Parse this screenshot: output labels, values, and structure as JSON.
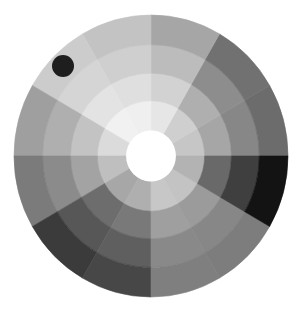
{
  "canvas": {
    "width": 300,
    "height": 314,
    "background": "#ffffff"
  },
  "wheel": {
    "center": {
      "x": 151,
      "y": 156
    },
    "radius_x": 137,
    "radius_y": 141,
    "hole_radius": 25,
    "hole_color": "#ffffff",
    "ring_radii": [
      25,
      54,
      81,
      109,
      138
    ],
    "sector_count": 12,
    "sector_angle_deg": 30,
    "angle_origin": "east, counterclockwise",
    "sectors": [
      {
        "from_deg": 0,
        "to_deg": 30,
        "ring_colors": [
          "#c6c6c6",
          "#a6a6a6",
          "#878787",
          "#6c6c6c"
        ]
      },
      {
        "from_deg": 30,
        "to_deg": 60,
        "ring_colors": [
          "#cfcfcf",
          "#afafaf",
          "#8d8d8d",
          "#717171"
        ]
      },
      {
        "from_deg": 60,
        "to_deg": 90,
        "ring_colors": [
          "#e6e6e6",
          "#d2d2d2",
          "#bcbcbc",
          "#a6a6a6"
        ]
      },
      {
        "from_deg": 90,
        "to_deg": 120,
        "ring_colors": [
          "#efefef",
          "#dfdfdf",
          "#cfcfcf",
          "#c3c3c3"
        ]
      },
      {
        "from_deg": 120,
        "to_deg": 150,
        "ring_colors": [
          "#f1f1f1",
          "#e3e3e3",
          "#d5d5d5",
          "#cccccc"
        ]
      },
      {
        "from_deg": 150,
        "to_deg": 180,
        "ring_colors": [
          "#dbdbdb",
          "#c3c3c3",
          "#afafaf",
          "#9f9f9f"
        ]
      },
      {
        "from_deg": 180,
        "to_deg": 210,
        "ring_colors": [
          "#bfbfbf",
          "#a3a3a3",
          "#8b8b8b",
          "#7b7b7b"
        ]
      },
      {
        "from_deg": 210,
        "to_deg": 240,
        "ring_colors": [
          "#a7a7a7",
          "#6d6d6d",
          "#575757",
          "#3b3b3b"
        ]
      },
      {
        "from_deg": 240,
        "to_deg": 270,
        "ring_colors": [
          "#afafaf",
          "#797979",
          "#5f5f5f",
          "#474747"
        ]
      },
      {
        "from_deg": 270,
        "to_deg": 300,
        "ring_colors": [
          "#c7c7c7",
          "#9f9f9f",
          "#898989",
          "#7f7f7f"
        ]
      },
      {
        "from_deg": 300,
        "to_deg": 330,
        "ring_colors": [
          "#c3c3c3",
          "#9b9b9b",
          "#878787",
          "#7d7d7d"
        ]
      },
      {
        "from_deg": 330,
        "to_deg": 360,
        "ring_colors": [
          "#b3b3b3",
          "#696969",
          "#3f3f3f",
          "#131313"
        ]
      }
    ]
  },
  "marker": {
    "label": "selection-dot",
    "x": 63,
    "y": 66,
    "radius": 11,
    "color": "#1e1e1e"
  }
}
